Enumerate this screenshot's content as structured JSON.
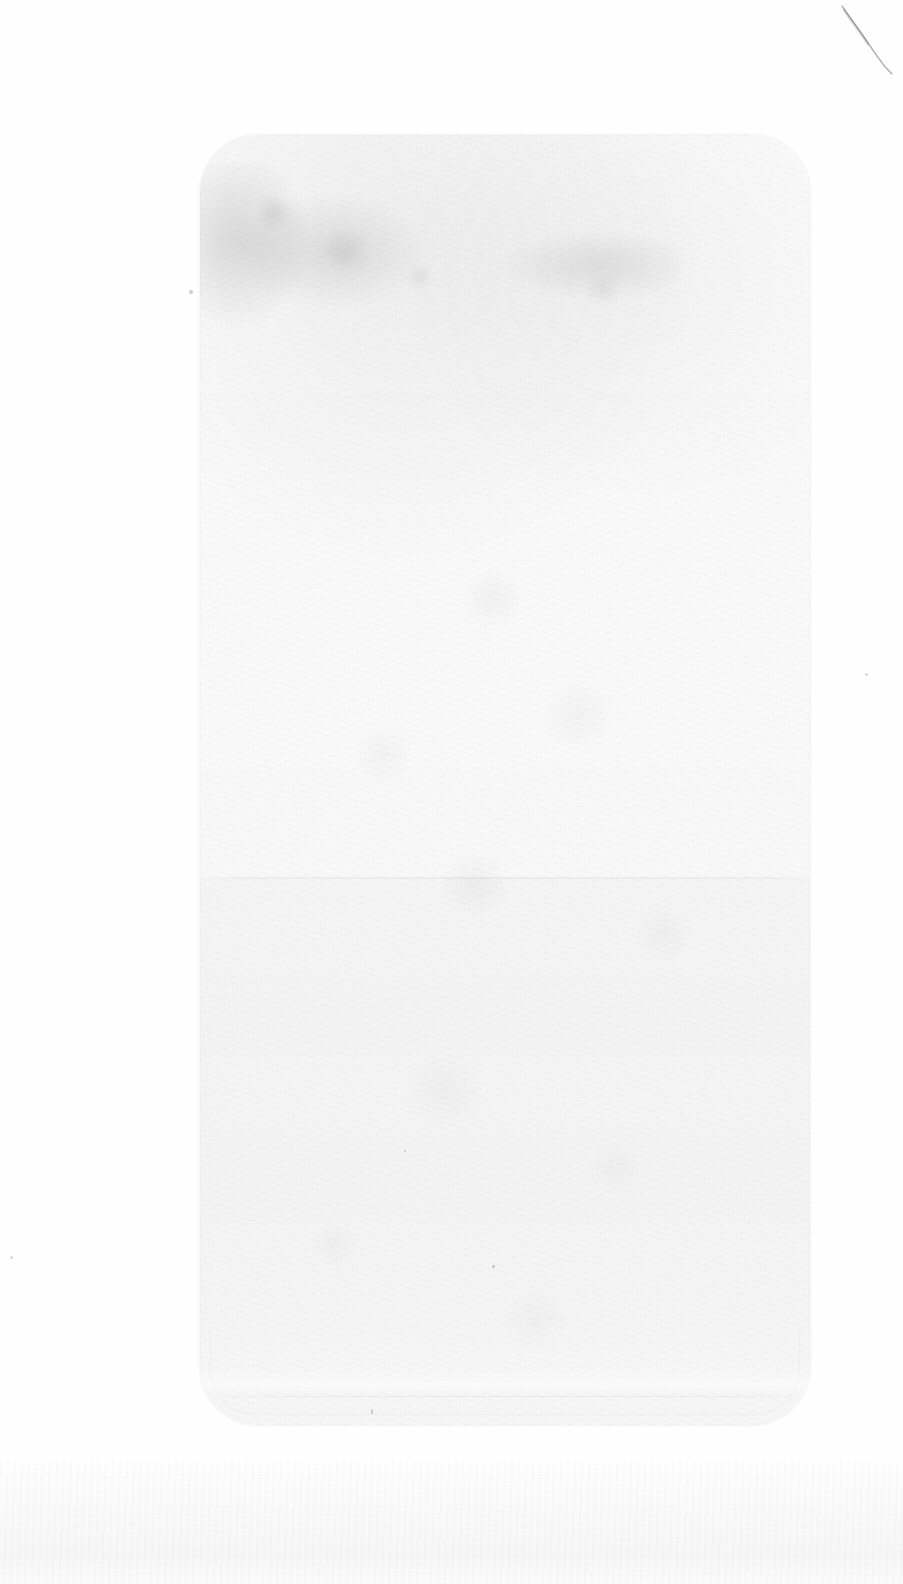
{
  "image": {
    "kind": "faded-scan",
    "width": 903,
    "height": 1584,
    "background_color": "#ffffff",
    "description_label": "",
    "legible_text": ""
  },
  "paper": {
    "name": "scanned-sheet",
    "color": "#ffffff",
    "grain_color": "#000000",
    "bottom_band": {
      "name": "bottom-texture-band",
      "height_px": 124,
      "label": ""
    }
  },
  "device": {
    "name": "phone-outline",
    "label": "",
    "x": 200,
    "y": 135,
    "width": 610,
    "height": 1290,
    "corner_radius": 58,
    "outline_color": "#000000",
    "outline_opacity": "0.03",
    "screen": {
      "upper_panel": {
        "name": "upper-panel",
        "label": "",
        "top": 135,
        "height": 742
      },
      "divider": {
        "name": "panel-divider",
        "label": "",
        "y": 877
      },
      "lower_panel": {
        "name": "lower-panel",
        "label": "",
        "top": 879,
        "height": 546
      },
      "inner_bezel": {
        "name": "inner-bezel-line",
        "label": "",
        "y": 1397
      }
    }
  },
  "artifacts": {
    "crease": {
      "name": "corner-crease",
      "label": "",
      "x": 836,
      "y": 4,
      "width": 60,
      "height": 74
    },
    "blots": [
      {
        "name": "toner-blot-upper-left",
        "label": ""
      },
      {
        "name": "toner-blot-upper-left-2",
        "label": ""
      },
      {
        "name": "toner-blot-upper-right",
        "label": ""
      }
    ],
    "specks": [
      {
        "name": "ink-speck",
        "label": ""
      },
      {
        "name": "ink-speck",
        "label": ""
      },
      {
        "name": "ink-speck",
        "label": ""
      },
      {
        "name": "ink-speck",
        "label": ""
      },
      {
        "name": "ink-speck",
        "label": ""
      },
      {
        "name": "ink-speck",
        "label": ""
      }
    ]
  }
}
